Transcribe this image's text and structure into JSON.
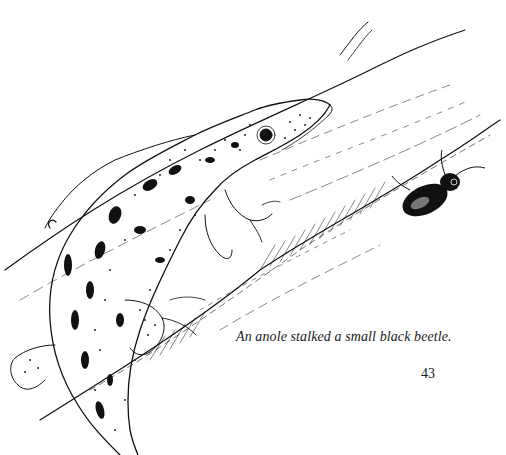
{
  "page": {
    "caption": "An anole stalked a small black beetle.",
    "page_number": "43"
  },
  "illustration": {
    "subject": "anole-lizard-on-branch",
    "secondary_subject": "black-beetle",
    "style": "pen-and-ink stipple drawing",
    "ink_color": "#111111",
    "paper_color": "#ffffff"
  }
}
